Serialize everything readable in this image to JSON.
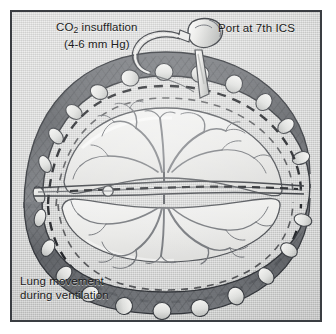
{
  "figure": {
    "kind": "medical-illustration",
    "frame_color": "#3a3d42",
    "plate_background": "#d6d7d6",
    "ink_color": "#3c3f44"
  },
  "labels": {
    "co2": {
      "line1_prefix": "CO",
      "line1_subscript": "2",
      "line1_suffix": " insufflation",
      "line2": "(4-6 mm Hg)"
    },
    "port": "Port at 7th ICS",
    "lung_movement": {
      "line1": "Lung movement",
      "line2": "during ventilation"
    }
  },
  "anatomy": {
    "structures": [
      "chest wall",
      "ribs",
      "parietal pleura",
      "collapsed lung (upper lobe)",
      "collapsed lung (lower lobe)",
      "hilum",
      "bronchial tree",
      "pulmonary vessels",
      "mediastinum",
      "lymph node"
    ],
    "rib_count_upper": 9,
    "rib_count_lower": 8,
    "dashed_line_meaning": "excursion of the lung during ventilation"
  },
  "instrument": {
    "name": "thoracoport-trocar",
    "parts": [
      "valve head",
      "insufflation tubing",
      "cannula shaft"
    ],
    "insertion_site": "7th intercostal space"
  },
  "icons": {
    "trocar": "trocar-icon",
    "tubing": "insufflation-tubing-icon"
  }
}
